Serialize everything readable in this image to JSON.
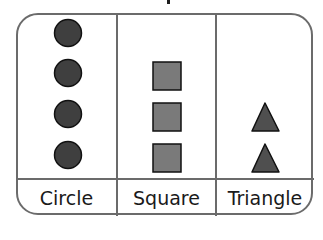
{
  "pictograph": {
    "columns": [
      {
        "label": "Circle",
        "shape": "circle",
        "count": 4
      },
      {
        "label": "Square",
        "shape": "square",
        "count": 3
      },
      {
        "label": "Triangle",
        "shape": "triangle",
        "count": 2
      }
    ],
    "colors": {
      "border": "#6b6b6b",
      "circle_fill": "#3f3f3f",
      "square_fill": "#7a7a7a",
      "triangle_fill": "#4f4f4f",
      "shape_stroke": "#111111"
    }
  }
}
